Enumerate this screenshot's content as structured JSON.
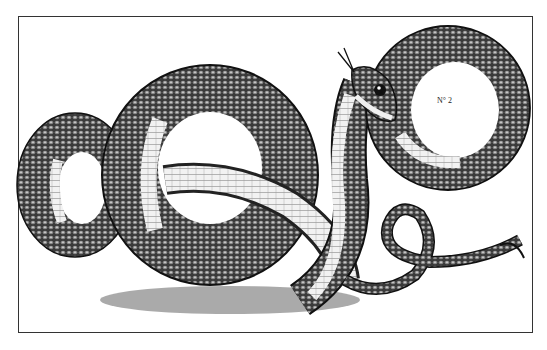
{
  "image": {
    "subject": "Engraved illustration of a coiled snake",
    "plate_label": "N° 2"
  }
}
